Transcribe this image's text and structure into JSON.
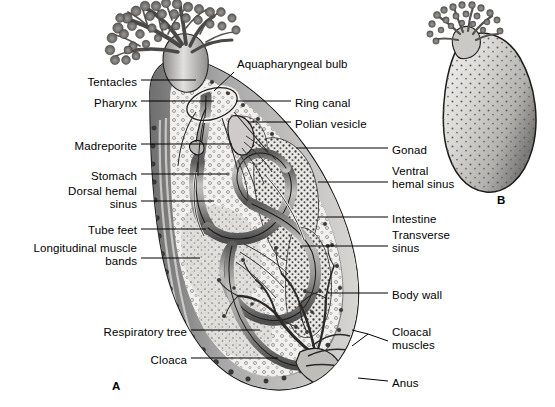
{
  "figure": {
    "background_color": "#ffffff",
    "ink_color": "#000000",
    "panels": [
      {
        "id": "A",
        "caption": "A",
        "x": 112,
        "y": 380,
        "description": "dissected lateral view showing internal organs"
      },
      {
        "id": "B",
        "caption": "B",
        "x": 497,
        "y": 194,
        "description": "whole animal external view, stippled body with tentacle crown"
      }
    ]
  },
  "labels_left": [
    {
      "name": "tentacles",
      "text": "Tentacles",
      "text_x": 137,
      "text_y": 84,
      "lines": 1,
      "leader": [
        [
          141,
          80
        ],
        [
          196,
          80
        ]
      ]
    },
    {
      "name": "pharynx",
      "text": "Pharynx",
      "text_x": 137,
      "text_y": 105,
      "lines": 1,
      "leader": [
        [
          141,
          101
        ],
        [
          214,
          101
        ]
      ]
    },
    {
      "name": "madreporite",
      "text": "Madreporite",
      "text_x": 137,
      "text_y": 148,
      "lines": 1,
      "leader": [
        [
          141,
          144
        ],
        [
          232,
          144
        ]
      ]
    },
    {
      "name": "stomach",
      "text": "Stomach",
      "text_x": 137,
      "text_y": 178,
      "lines": 1,
      "leader": [
        [
          141,
          174
        ],
        [
          229,
          174
        ]
      ]
    },
    {
      "name": "dorsal-hemal-sinus",
      "text": "Dorsal hemal\nsinus",
      "text_x": 137,
      "text_y": 199,
      "lines": 2,
      "leader": [
        [
          141,
          201
        ],
        [
          214,
          201
        ]
      ]
    },
    {
      "name": "tube-feet",
      "text": "Tube feet",
      "text_x": 137,
      "text_y": 232,
      "lines": 1,
      "leader": [
        [
          141,
          229
        ],
        [
          206,
          229
        ]
      ]
    },
    {
      "name": "longitudinal-muscle-bands",
      "text": "Longitudinal muscle\nbands",
      "text_x": 137,
      "text_y": 256,
      "lines": 2,
      "leader": [
        [
          141,
          258
        ],
        [
          200,
          258
        ]
      ]
    },
    {
      "name": "respiratory-tree",
      "text": "Respiratory tree",
      "text_x": 187,
      "text_y": 334,
      "lines": 1,
      "leader": [
        [
          191,
          330
        ],
        [
          260,
          330
        ]
      ]
    },
    {
      "name": "cloaca",
      "text": "Cloaca",
      "text_x": 187,
      "text_y": 362,
      "lines": 1,
      "leader": [
        [
          191,
          358
        ],
        [
          278,
          358
        ]
      ]
    }
  ],
  "labels_right": [
    {
      "name": "aquapharyngeal-bulb",
      "text": "Aquapharyngeal bulb",
      "text_x": 237,
      "text_y": 66,
      "lines": 1,
      "leader": [
        [
          234,
          72
        ],
        [
          214,
          91
        ]
      ]
    },
    {
      "name": "ring-canal",
      "text": "Ring canal",
      "text_x": 295,
      "text_y": 105,
      "lines": 1,
      "leader": [
        [
          291,
          101
        ],
        [
          236,
          101
        ]
      ]
    },
    {
      "name": "polian-vesicle",
      "text": "Polian vesicle",
      "text_x": 295,
      "text_y": 126,
      "lines": 1,
      "leader": [
        [
          291,
          122
        ],
        [
          248,
          122
        ]
      ]
    },
    {
      "name": "gonad",
      "text": "Gonad",
      "text_x": 392,
      "text_y": 152,
      "lines": 1,
      "leader": [
        [
          388,
          148
        ],
        [
          296,
          148
        ]
      ]
    },
    {
      "name": "ventral-hemal-sinus",
      "text": "Ventral\nhemal sinus",
      "text_x": 392,
      "text_y": 179,
      "lines": 2,
      "leader": [
        [
          388,
          182
        ],
        [
          318,
          182
        ]
      ]
    },
    {
      "name": "intestine",
      "text": "Intestine",
      "text_x": 392,
      "text_y": 221,
      "lines": 1,
      "leader": [
        [
          388,
          217
        ],
        [
          318,
          217
        ]
      ]
    },
    {
      "name": "transverse-sinus",
      "text": "Transverse\nsinus",
      "text_x": 392,
      "text_y": 243,
      "lines": 2,
      "leader": [
        [
          388,
          246
        ],
        [
          300,
          246
        ]
      ]
    },
    {
      "name": "body-wall",
      "text": "Body wall",
      "text_x": 392,
      "text_y": 297,
      "lines": 1,
      "leader": [
        [
          388,
          293
        ],
        [
          328,
          293
        ]
      ]
    },
    {
      "name": "cloacal-muscles",
      "text": "Cloacal\nmuscles",
      "text_x": 392,
      "text_y": 340,
      "lines": 2,
      "leader": [
        [
          388,
          341
        ],
        [
          355,
          338
        ]
      ]
    },
    {
      "name": "anus",
      "text": "Anus",
      "text_x": 392,
      "text_y": 385,
      "lines": 1,
      "leader": [
        [
          388,
          381
        ],
        [
          358,
          378
        ]
      ]
    }
  ],
  "anatomy_parts": [
    "Tentacles",
    "Pharynx",
    "Madreporite",
    "Stomach",
    "Dorsal hemal sinus",
    "Tube feet",
    "Longitudinal muscle bands",
    "Respiratory tree",
    "Cloaca",
    "Aquapharyngeal bulb",
    "Ring canal",
    "Polian vesicle",
    "Gonad",
    "Ventral hemal sinus",
    "Intestine",
    "Transverse sinus",
    "Body wall",
    "Cloacal muscles",
    "Anus"
  ]
}
